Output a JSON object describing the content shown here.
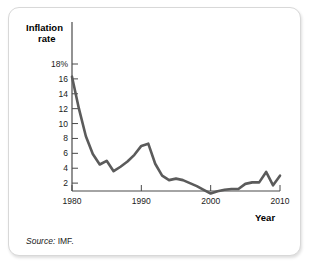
{
  "figure": {
    "y_axis_title_line1": "Inflation",
    "y_axis_title_line2": "rate",
    "x_axis_title": "Year",
    "source_prefix": "Source:",
    "source_value": "IMF.",
    "line_color": "#5b5b5b",
    "axis_color": "#4a4a4a",
    "card_border_color": "#d8d8d8",
    "background_color": "#ffffff"
  },
  "chart_data": {
    "type": "line",
    "title": "",
    "subtitle": "",
    "xlabel": "Year",
    "ylabel": "Inflation rate",
    "xlim": [
      1980,
      2010
    ],
    "ylim": [
      0,
      19
    ],
    "grid": false,
    "legend": "none",
    "xticks": [
      1980,
      1990,
      2000,
      2010
    ],
    "xticklabels": [
      "1980",
      "1990",
      "2000",
      "2010"
    ],
    "yticks": [
      2,
      4,
      6,
      8,
      10,
      12,
      14,
      16,
      18
    ],
    "yticklabels": [
      "2",
      "4",
      "6",
      "8",
      "10",
      "12",
      "14",
      "16",
      "18%"
    ],
    "series": [
      {
        "name": "Inflation rate",
        "x": [
          1980,
          1981,
          1982,
          1983,
          1984,
          1985,
          1986,
          1987,
          1988,
          1989,
          1990,
          1991,
          1992,
          1993,
          1994,
          1995,
          1996,
          1997,
          1998,
          1999,
          2000,
          2001,
          2002,
          2003,
          2004,
          2005,
          2006,
          2007,
          2008,
          2009,
          2010
        ],
        "values": [
          16.3,
          12.0,
          8.3,
          5.9,
          4.5,
          5.0,
          3.6,
          4.2,
          4.9,
          5.8,
          7.0,
          7.3,
          4.6,
          3.0,
          2.4,
          2.6,
          2.4,
          2.0,
          1.6,
          1.1,
          0.6,
          0.9,
          1.1,
          1.2,
          1.2,
          1.9,
          2.1,
          2.1,
          3.5,
          1.7,
          3.0
        ]
      }
    ],
    "annotations": [
      "Source: IMF."
    ]
  }
}
